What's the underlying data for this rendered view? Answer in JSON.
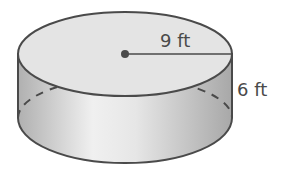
{
  "diagram": {
    "shape": "cylinder",
    "radius_label": "9 ft",
    "height_label": "6 ft",
    "colors": {
      "outline": "#4a4a4a",
      "top_fill": "#e4e4e4",
      "side_light": "#eeeeee",
      "side_dark": "#b5b5b5",
      "label": "#4a4a4a"
    }
  }
}
